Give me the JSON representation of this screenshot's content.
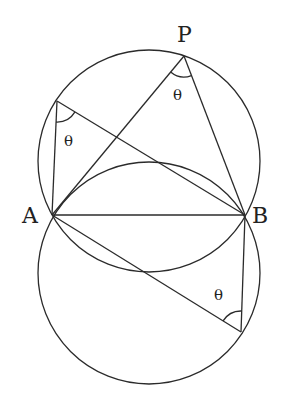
{
  "diagram": {
    "type": "geometry",
    "colors": {
      "stroke": "#2b2b2b",
      "background": "#ffffff"
    },
    "circles": [
      {
        "id": "upper",
        "cx": 149,
        "cy": 161,
        "r": 111
      },
      {
        "id": "lower",
        "cx": 149,
        "cy": 273,
        "r": 111
      }
    ],
    "points": {
      "A": {
        "label": "A",
        "x": 52,
        "y": 215,
        "label_x": 22,
        "label_y": 223
      },
      "B": {
        "label": "B",
        "x": 245,
        "y": 215,
        "label_x": 252,
        "label_y": 223
      },
      "P": {
        "label": "P",
        "x": 184,
        "y": 56,
        "label_x": 177,
        "label_y": 42
      },
      "C": {
        "label": "",
        "x": 57,
        "y": 101
      },
      "D": {
        "label": "",
        "x": 241,
        "y": 332
      }
    },
    "segments": [
      [
        "A",
        "B"
      ],
      [
        "A",
        "P"
      ],
      [
        "P",
        "B"
      ],
      [
        "C",
        "A"
      ],
      [
        "C",
        "B"
      ],
      [
        "A",
        "D"
      ],
      [
        "B",
        "D"
      ]
    ],
    "angles": [
      {
        "vertex": "P",
        "label": "θ",
        "label_x": 173,
        "label_y": 100
      },
      {
        "vertex": "C",
        "label": "θ",
        "label_x": 64,
        "label_y": 146
      },
      {
        "vertex": "D",
        "label": "θ",
        "label_x": 214,
        "label_y": 300
      }
    ]
  }
}
